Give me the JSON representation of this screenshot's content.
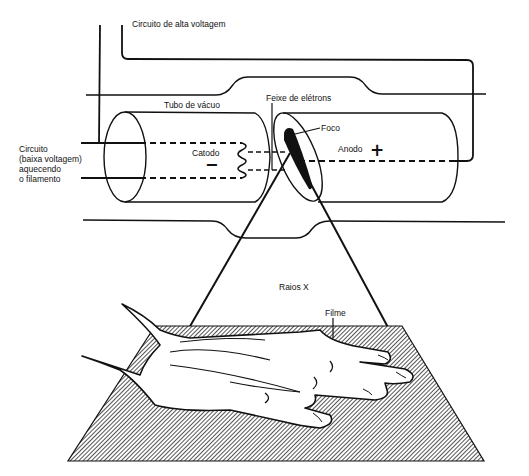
{
  "diagram": {
    "type": "x-ray tube schematic",
    "labels": {
      "high_voltage_circuit": "Circuito de alta voltagem",
      "vacuum_tube": "Tubo de vácuo",
      "electron_beam": "Feixe de elétrons",
      "focus": "Foco",
      "cathode": "Catodo",
      "anode": "Anodo",
      "low_voltage_circuit_line1": "Circuito",
      "low_voltage_circuit_line2": "(baixa voltagem)",
      "low_voltage_circuit_line3": "aquecendo",
      "low_voltage_circuit_line4": "o filamento",
      "xrays": "Raios X",
      "film": "Filme"
    },
    "symbols": {
      "cathode_sign": "−",
      "anode_sign": "+"
    },
    "colors": {
      "line": "#111111",
      "background": "#ffffff",
      "film_hatch": "#333333"
    }
  }
}
